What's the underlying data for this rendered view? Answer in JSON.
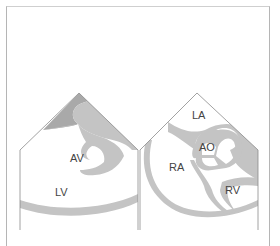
{
  "figure": {
    "left_panel": {
      "labels": {
        "av": "AV",
        "lv": "LV"
      }
    },
    "right_panel": {
      "labels": {
        "la": "LA",
        "ao": "AO",
        "ra": "RA",
        "rv": "RV"
      }
    },
    "colors": {
      "tissue": "#c4c4c4",
      "outline": "#8a8a8a",
      "background": "#ffffff"
    }
  }
}
